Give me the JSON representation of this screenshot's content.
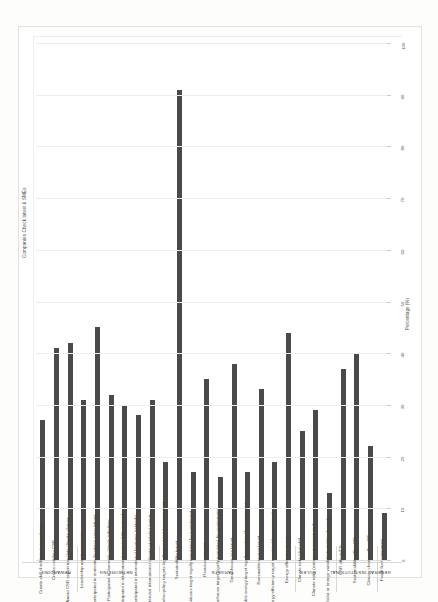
{
  "figure": {
    "title": "Companies Check latest & SMEs",
    "axis_label": "Percentage (%)",
    "accent_color": "#4a4a4a",
    "grid_color": "#eeeeec"
  },
  "chart_data": {
    "type": "bar",
    "orientation": "vertical",
    "title": "Companies Check latest & SMEs",
    "xlabel": "",
    "ylabel": "Percentage (%)",
    "ylim": [
      0,
      100
    ],
    "yticks": [
      0,
      10,
      20,
      30,
      40,
      50,
      60,
      70,
      80,
      90,
      100
    ],
    "ytick_labels": [
      "0",
      "10",
      "20",
      "30",
      "40",
      "50",
      "60",
      "70",
      "80",
      "90",
      "100"
    ],
    "grid": true,
    "legend": null,
    "groups": [
      {
        "name": "REWARDING",
        "categories": [
          "Create skill checklists to incentives",
          "Create certified CSR",
          "Award CSR expert translate climate change"
        ],
        "values": [
          27,
          41,
          42
        ]
      },
      {
        "name": "NETWORKING",
        "categories": [
          "Leadership way to resources",
          "Participated in domestic business associations",
          "Participated in domestic climate initiatives",
          "Participated in international sustainability networks",
          "Participated in international business networks",
          "Attended international climate or related events"
        ],
        "values": [
          31,
          45,
          32,
          30,
          28,
          31
        ]
      },
      {
        "name": "TARGETS",
        "categories": [
          "Resource/recycling targets legally mandated by government",
          "Sustainability target",
          "Residuous target legally mandated by government",
          "Residuous target",
          "Greenhouse target legally mandated by government",
          "Greenhouse gas target",
          "Renewable energy target legally mandated by government",
          "Renewable energy target",
          "Energy efficiency target mandated by government",
          "Energy efficiency target"
        ],
        "values": [
          19,
          91,
          17,
          35,
          16,
          38,
          17,
          33,
          19,
          44
        ]
      },
      {
        "name": "RULES",
        "categories": [
          "Climate risks (drought)",
          "Climate risks (extreme temperatures)",
          "Solar or energy variability/volatility of supply"
        ],
        "values": [
          25,
          29,
          13
        ]
      },
      {
        "name": "INSTITUTIONAL",
        "categories": [
          "CSR officer/CS",
          "Sustainability officer/CS",
          "Climate change officer/CS"
        ],
        "values": [
          37,
          40,
          22
        ]
      },
      {
        "name": "GENERAL",
        "categories": [
          "Fossil fuel companies"
        ],
        "values": [
          9
        ]
      }
    ]
  }
}
